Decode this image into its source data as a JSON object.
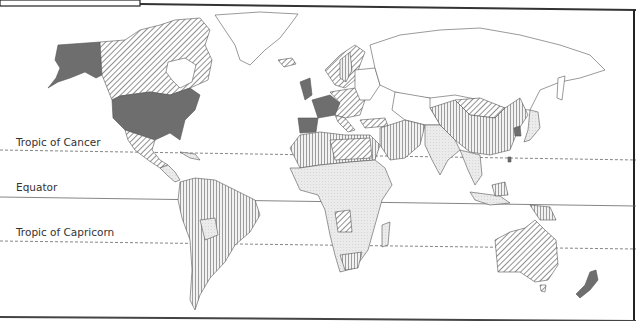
{
  "map": {
    "title_box": "",
    "latitude_lines": [
      {
        "label": "Tropic of Cancer",
        "style": "dashed"
      },
      {
        "label": "Equator",
        "style": "solid"
      },
      {
        "label": "Tropic of Capricorn",
        "style": "dashed"
      }
    ],
    "fill_categories": [
      {
        "pattern": "solid-dark",
        "color": "#6e6e6e"
      },
      {
        "pattern": "diagonal-hatch",
        "color": "#555555"
      },
      {
        "pattern": "vertical-hatch",
        "color": "#777777"
      },
      {
        "pattern": "light-stipple",
        "color": "#e6e6e6"
      },
      {
        "pattern": "none",
        "color": "#ffffff"
      }
    ],
    "regions": [
      {
        "name": "Alaska / USA",
        "pattern": "solid-dark"
      },
      {
        "name": "Canada",
        "pattern": "diagonal-hatch"
      },
      {
        "name": "Greenland",
        "pattern": "none"
      },
      {
        "name": "Mexico",
        "pattern": "diagonal-hatch"
      },
      {
        "name": "South America",
        "pattern": "vertical-hatch"
      },
      {
        "name": "Western Europe",
        "pattern": "solid-dark"
      },
      {
        "name": "Central/Northern Europe",
        "pattern": "diagonal-hatch"
      },
      {
        "name": "Russia",
        "pattern": "none"
      },
      {
        "name": "North Africa",
        "pattern": "vertical-hatch"
      },
      {
        "name": "Sub-Saharan Africa",
        "pattern": "light-stipple"
      },
      {
        "name": "Middle East",
        "pattern": "vertical-hatch"
      },
      {
        "name": "China",
        "pattern": "vertical-hatch"
      },
      {
        "name": "Mongolia",
        "pattern": "diagonal-hatch"
      },
      {
        "name": "India / South Asia",
        "pattern": "light-stipple"
      },
      {
        "name": "South Korea",
        "pattern": "solid-dark"
      },
      {
        "name": "Japan",
        "pattern": "light-stipple"
      },
      {
        "name": "Southeast Asia",
        "pattern": "light-stipple"
      },
      {
        "name": "Australia",
        "pattern": "diagonal-hatch"
      },
      {
        "name": "New Zealand",
        "pattern": "solid-dark"
      }
    ]
  }
}
